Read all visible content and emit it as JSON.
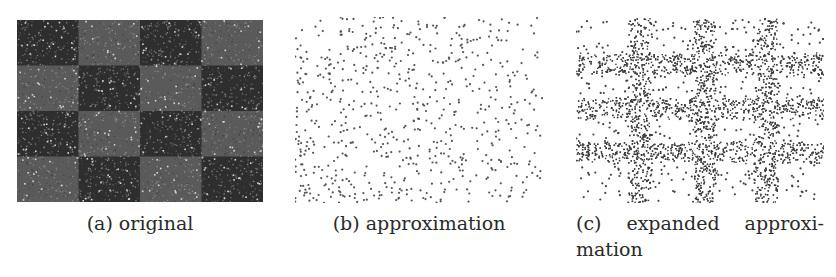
{
  "figure": {
    "subfigures": [
      {
        "id": "a",
        "label": "(a)",
        "caption": "original",
        "image": {
          "description": "4x4 checkerboard of dark and medium-gray noisy texture with sparse white speckles",
          "grid": [
            4,
            4
          ],
          "dark_color": "#2e2e2e",
          "light_color": "#5a5a5a",
          "speckle_color": "#d8d8d8"
        }
      },
      {
        "id": "b",
        "label": "(b)",
        "caption": "approximation",
        "image": {
          "description": "Stippled point set of small gray dots on white, denser toward the upper-left and lower-left",
          "dot_color": "#555555"
        }
      },
      {
        "id": "c",
        "label": "(c)",
        "caption_line1": [
          "expanded",
          "approxi-"
        ],
        "caption_line2": "mation",
        "image": {
          "description": "Stippled image: dense dark grid of 3 vertical and 3 horizontal bars over sparse dots on white",
          "vertical_bars_x": [
            64,
            128,
            190
          ],
          "horizontal_bars_y": [
            46,
            90,
            134
          ],
          "bar_color": "#3a3a3a",
          "dot_color": "#444444"
        }
      }
    ]
  }
}
